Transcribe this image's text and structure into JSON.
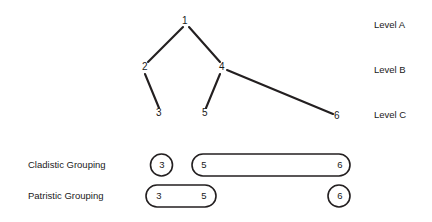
{
  "figure": {
    "stroke_color": "#231f20",
    "text_color": "#1a1a1a",
    "background": "#ffffff"
  },
  "tree": {
    "nodes": [
      {
        "id": "1",
        "label": "1",
        "x": 185,
        "y": 22,
        "level": "Level A"
      },
      {
        "id": "2",
        "label": "2",
        "x": 145,
        "y": 68,
        "level": "Level B"
      },
      {
        "id": "4",
        "label": "4",
        "x": 222,
        "y": 68,
        "level": "Level B"
      },
      {
        "id": "3",
        "label": "3",
        "x": 159,
        "y": 114,
        "level": "Level C"
      },
      {
        "id": "5",
        "label": "5",
        "x": 205,
        "y": 114,
        "level": "Level C"
      },
      {
        "id": "6",
        "label": "6",
        "x": 337,
        "y": 117,
        "level": "Level C"
      }
    ],
    "edges": [
      {
        "from": "1",
        "to": "2"
      },
      {
        "from": "1",
        "to": "4"
      },
      {
        "from": "2",
        "to": "3"
      },
      {
        "from": "4",
        "to": "5"
      },
      {
        "from": "4",
        "to": "6"
      }
    ]
  },
  "levels": [
    {
      "id": "level-a",
      "label": "Level A",
      "y": 25
    },
    {
      "id": "level-b",
      "label": "Level B",
      "y": 70
    },
    {
      "id": "level-c",
      "label": "Level C",
      "y": 115
    }
  ],
  "groupings": [
    {
      "id": "cladistic",
      "label": "Cladistic Grouping",
      "groups": [
        {
          "shape": "circle",
          "members": [
            "3"
          ]
        },
        {
          "shape": "capsule",
          "members": [
            "5",
            "6"
          ]
        }
      ]
    },
    {
      "id": "patristic",
      "label": "Patristic Grouping",
      "groups": [
        {
          "shape": "capsule",
          "members": [
            "3",
            "5"
          ]
        },
        {
          "shape": "circle",
          "members": [
            "6"
          ]
        }
      ]
    }
  ],
  "grouping_labels": {
    "cladistic": "Cladistic Grouping",
    "patristic": "Patristic Grouping"
  },
  "grouping_members": {
    "cladistic_a_3": "3",
    "cladistic_b_5": "5",
    "cladistic_b_6": "6",
    "patristic_a_3": "3",
    "patristic_a_5": "5",
    "patristic_b_6": "6"
  },
  "node_labels": {
    "n1": "1",
    "n2": "2",
    "n3": "3",
    "n4": "4",
    "n5": "5",
    "n6": "6"
  },
  "level_labels": {
    "a": "Level A",
    "b": "Level B",
    "c": "Level C"
  }
}
